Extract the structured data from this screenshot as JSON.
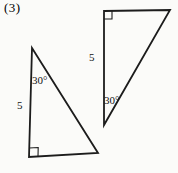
{
  "figure_label": "(3)",
  "colors": {
    "background": "#fbfbf9",
    "stroke": "#1c1c1c",
    "text": "#111111"
  },
  "diagram": {
    "width": 178,
    "height": 173,
    "triangles": [
      {
        "name": "left-triangle",
        "vertices": [
          [
            32,
            48
          ],
          [
            29,
            157
          ],
          [
            98,
            153
          ]
        ],
        "right_angle_vertex_index": 1,
        "right_angle_size": 9,
        "labels": [
          {
            "name": "left-triangle-angle-label",
            "text": "30°",
            "x": 32,
            "y": 84
          },
          {
            "name": "left-triangle-side-label",
            "text": "5",
            "x": 17,
            "y": 109
          }
        ]
      },
      {
        "name": "right-triangle",
        "vertices": [
          [
            104,
            11
          ],
          [
            170,
            10
          ],
          [
            104,
            125
          ]
        ],
        "right_angle_vertex_index": 0,
        "right_angle_size": 8,
        "labels": [
          {
            "name": "right-triangle-side-label",
            "text": "5",
            "x": 89,
            "y": 61
          },
          {
            "name": "right-triangle-angle-label",
            "text": "30°",
            "x": 104,
            "y": 104
          }
        ]
      }
    ]
  }
}
